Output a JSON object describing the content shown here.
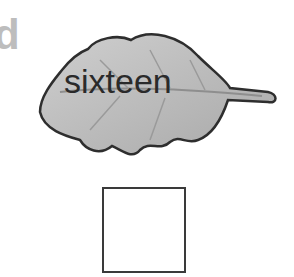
{
  "partial_letter": "d",
  "leaf": {
    "word": "sixteen",
    "fill": "#bcbcbc",
    "outline": "#2e2e2e"
  },
  "answer_box": {
    "value": ""
  }
}
